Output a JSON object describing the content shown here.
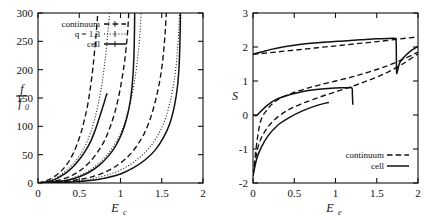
{
  "figure": {
    "background": "#ffffff",
    "ink": "#111111",
    "panel_count": 2
  },
  "chart_data": [
    {
      "panel": "left",
      "type": "line",
      "title": "",
      "xlabel": "E_c",
      "ylabel": "f/f0",
      "ylabel_numerator": "f",
      "ylabel_denominator": "f",
      "ylabel_denominator_sub": "0",
      "xlim": [
        0,
        2
      ],
      "ylim": [
        0,
        300
      ],
      "xticks": [
        0,
        0.5,
        1,
        1.5,
        2
      ],
      "xticklabels": [
        "0",
        "0.5",
        "1",
        "1.5",
        "2"
      ],
      "yticks": [
        0,
        50,
        100,
        150,
        200,
        250,
        300
      ],
      "yticklabels": [
        "0",
        "50",
        "100",
        "150",
        "200",
        "250",
        "300"
      ],
      "grid": false,
      "legend_position": "top-left",
      "legend": [
        {
          "label": "continuum",
          "style": "dashed"
        },
        {
          "label": "q = 1.3",
          "style": "dotted"
        },
        {
          "label": "cell",
          "style": "solid"
        }
      ],
      "series": [
        {
          "name": "continuum-1",
          "style": "dashed",
          "x": [
            0.0,
            0.08,
            0.16,
            0.24,
            0.3,
            0.36,
            0.42,
            0.47,
            0.52,
            0.56,
            0.6,
            0.63,
            0.66,
            0.68,
            0.7,
            0.715,
            0.725
          ],
          "y": [
            0,
            3,
            8,
            16,
            24,
            35,
            50,
            67,
            88,
            110,
            136,
            163,
            196,
            224,
            255,
            282,
            300
          ]
        },
        {
          "name": "q1.3-1",
          "style": "dotted",
          "x": [
            0.0,
            0.1,
            0.2,
            0.28,
            0.36,
            0.44,
            0.52,
            0.58,
            0.64,
            0.69,
            0.73,
            0.77,
            0.8,
            0.825,
            0.845,
            0.86,
            0.87
          ],
          "y": [
            0,
            3,
            8,
            15,
            24,
            36,
            52,
            68,
            90,
            114,
            139,
            170,
            201,
            232,
            262,
            288,
            300
          ]
        },
        {
          "name": "cell-1",
          "style": "solid",
          "x": [
            0.0,
            0.1,
            0.2,
            0.28,
            0.36,
            0.44,
            0.52,
            0.58,
            0.64,
            0.69,
            0.73,
            0.77,
            0.8,
            0.822,
            0.835,
            0.842
          ],
          "y": [
            0,
            2,
            6,
            12,
            20,
            31,
            45,
            58,
            74,
            92,
            109,
            127,
            141,
            152,
            157,
            158
          ]
        },
        {
          "name": "continuum-2",
          "style": "dashed",
          "x": [
            0.0,
            0.15,
            0.3,
            0.42,
            0.52,
            0.62,
            0.72,
            0.8,
            0.87,
            0.93,
            0.98,
            1.02,
            1.05,
            1.075,
            1.09,
            1.1
          ],
          "y": [
            0,
            2,
            7,
            14,
            23,
            36,
            54,
            73,
            97,
            124,
            154,
            186,
            215,
            248,
            275,
            300
          ]
        },
        {
          "name": "q1.3-2",
          "style": "dotted",
          "x": [
            0.0,
            0.18,
            0.36,
            0.5,
            0.62,
            0.74,
            0.85,
            0.94,
            1.02,
            1.08,
            1.13,
            1.17,
            1.2,
            1.225,
            1.24,
            1.25
          ],
          "y": [
            0,
            2,
            6,
            13,
            22,
            35,
            52,
            71,
            94,
            120,
            149,
            180,
            211,
            245,
            273,
            300
          ]
        },
        {
          "name": "cell-2",
          "style": "solid",
          "x": [
            0.0,
            0.18,
            0.36,
            0.5,
            0.62,
            0.74,
            0.85,
            0.94,
            1.02,
            1.08,
            1.12,
            1.145,
            1.16,
            1.168,
            1.172
          ],
          "y": [
            0,
            2,
            5,
            11,
            19,
            31,
            47,
            65,
            89,
            117,
            146,
            178,
            214,
            255,
            300
          ]
        },
        {
          "name": "continuum-3",
          "style": "dashed",
          "x": [
            0.0,
            0.25,
            0.5,
            0.68,
            0.84,
            0.98,
            1.1,
            1.2,
            1.29,
            1.36,
            1.42,
            1.47,
            1.505,
            1.53,
            1.545,
            1.555
          ],
          "y": [
            0,
            2,
            6,
            12,
            21,
            33,
            48,
            66,
            88,
            113,
            143,
            176,
            208,
            244,
            274,
            300
          ]
        },
        {
          "name": "q1.3-3",
          "style": "dotted",
          "x": [
            0.0,
            0.28,
            0.56,
            0.76,
            0.94,
            1.1,
            1.24,
            1.36,
            1.46,
            1.54,
            1.6,
            1.645,
            1.675,
            1.695,
            1.708,
            1.715
          ],
          "y": [
            0,
            2,
            5,
            11,
            19,
            31,
            46,
            64,
            86,
            112,
            142,
            175,
            208,
            243,
            273,
            300
          ]
        },
        {
          "name": "cell-3",
          "style": "solid",
          "x": [
            0.0,
            0.3,
            0.6,
            0.82,
            1.0,
            1.16,
            1.3,
            1.42,
            1.52,
            1.6,
            1.655,
            1.692,
            1.712,
            1.722,
            1.727
          ],
          "y": [
            0,
            1,
            4,
            9,
            16,
            27,
            41,
            58,
            80,
            106,
            137,
            172,
            212,
            258,
            300
          ]
        }
      ]
    },
    {
      "panel": "right",
      "type": "line",
      "title": "",
      "xlabel": "E_e",
      "ylabel": "S",
      "xlim": [
        0,
        2
      ],
      "ylim": [
        -2,
        3
      ],
      "xticks": [
        0,
        0.5,
        1,
        1.5,
        2
      ],
      "xticklabels": [
        "0",
        "0.5",
        "1",
        "1.5",
        "2"
      ],
      "yticks": [
        -2,
        -1,
        0,
        1,
        2,
        3
      ],
      "yticklabels": [
        "-2",
        "-1",
        "0",
        "1",
        "2",
        "3"
      ],
      "grid": false,
      "legend_position": "bottom-right",
      "legend": [
        {
          "label": "continuum",
          "style": "dashed"
        },
        {
          "label": "cell",
          "style": "solid"
        }
      ],
      "series": [
        {
          "name": "continuum-upper",
          "style": "dashed",
          "x": [
            0.0,
            0.15,
            0.35,
            0.55,
            0.75,
            0.95,
            1.15,
            1.35,
            1.55,
            1.75,
            1.9,
            2.0
          ],
          "y": [
            1.79,
            1.82,
            1.87,
            1.92,
            1.97,
            2.02,
            2.07,
            2.12,
            2.17,
            2.23,
            2.27,
            2.3
          ]
        },
        {
          "name": "cell-upper",
          "style": "solid",
          "x": [
            0.0,
            0.1,
            0.22,
            0.36,
            0.52,
            0.7,
            0.9,
            1.1,
            1.3,
            1.5,
            1.65,
            1.72,
            1.735,
            1.74,
            1.75,
            1.78,
            1.85,
            1.92,
            2.0
          ],
          "y": [
            1.79,
            1.85,
            1.93,
            2.0,
            2.06,
            2.11,
            2.15,
            2.18,
            2.21,
            2.24,
            2.25,
            2.25,
            2.15,
            1.3,
            1.28,
            1.55,
            1.75,
            1.9,
            2.02
          ]
        },
        {
          "name": "continuum-middle",
          "style": "dashed",
          "x": [
            0.0,
            0.08,
            0.18,
            0.3,
            0.45,
            0.62,
            0.8,
            1.0,
            1.2,
            1.4,
            1.6,
            1.8,
            2.0
          ],
          "y": [
            -1.75,
            -0.3,
            0.18,
            0.45,
            0.62,
            0.76,
            0.88,
            1.0,
            1.12,
            1.26,
            1.42,
            1.62,
            1.85
          ]
        },
        {
          "name": "cell-middle",
          "style": "solid",
          "x": [
            0.0,
            0.04,
            0.1,
            0.18,
            0.3,
            0.45,
            0.62,
            0.8,
            0.95,
            1.08,
            1.16,
            1.2,
            1.205,
            1.21
          ],
          "y": [
            0.02,
            -0.02,
            0.12,
            0.3,
            0.48,
            0.6,
            0.7,
            0.76,
            0.79,
            0.8,
            0.8,
            0.79,
            0.6,
            0.3
          ]
        },
        {
          "name": "continuum-lower",
          "style": "dashed",
          "x": [
            0.0,
            0.06,
            0.14,
            0.26,
            0.42,
            0.6,
            0.8,
            1.0,
            1.2,
            1.4,
            1.6,
            1.8,
            2.0
          ],
          "y": [
            -1.78,
            -0.95,
            -0.5,
            -0.14,
            0.14,
            0.34,
            0.52,
            0.68,
            0.84,
            1.02,
            1.22,
            1.48,
            1.8
          ]
        },
        {
          "name": "cell-lower",
          "style": "solid",
          "x": [
            0.0,
            0.02,
            0.05,
            0.1,
            0.18,
            0.3,
            0.45,
            0.6,
            0.75,
            0.88,
            0.92
          ],
          "y": [
            -1.8,
            -1.55,
            -1.25,
            -0.95,
            -0.62,
            -0.3,
            -0.06,
            0.12,
            0.26,
            0.35,
            0.37
          ]
        }
      ]
    }
  ]
}
